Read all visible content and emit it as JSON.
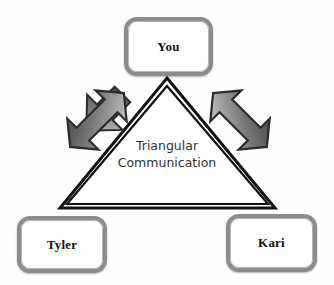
{
  "diagram": {
    "title": "Triangular Communication",
    "caption_lines": [
      "Triangular",
      "Communication"
    ],
    "background_color": "#fefefe",
    "nodes": [
      {
        "id": "you",
        "label": "You",
        "position": "top"
      },
      {
        "id": "tyler",
        "label": "Tyler",
        "position": "bottom-left"
      },
      {
        "id": "kari",
        "label": "Kari",
        "position": "bottom-right"
      }
    ],
    "shapes": {
      "triangle": {
        "name": "double-outline-triangle",
        "outline_color": "#111111",
        "fill_color": "#ffffff",
        "apex": [
          167,
          78
        ],
        "base_left": [
          60,
          208
        ],
        "base_right": [
          275,
          208
        ]
      },
      "arrows": [
        {
          "id": "arrow-left",
          "name": "double-headed-arrow",
          "direction": "bidirectional",
          "rotation_deg": -45,
          "fill_start_color": "#4a4a4a",
          "fill_end_color": "#d2d2d2",
          "outline_color": "#2a2a2a"
        },
        {
          "id": "arrow-right",
          "name": "double-headed-arrow",
          "direction": "bidirectional",
          "rotation_deg": 45,
          "fill_start_color": "#4a4a4a",
          "fill_end_color": "#d2d2d2",
          "outline_color": "#2a2a2a"
        }
      ]
    },
    "node_style": {
      "border_color": "#8c8c8c",
      "inner_border_color": "#b4b4b4",
      "fill_color": "#ffffff",
      "text_color": "#111111"
    }
  }
}
